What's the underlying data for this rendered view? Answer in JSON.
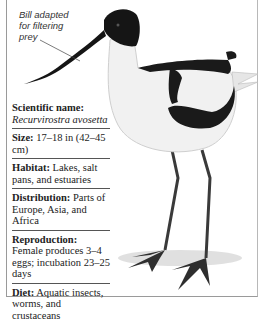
{
  "callout": {
    "text": "Bill adapted for filtering prey"
  },
  "image": {
    "subject": "Pied avocet standing, side view",
    "icon": "bird-illustration"
  },
  "facts": [
    {
      "key": "Scientific name:",
      "value": "Recurvirostra avosetta"
    },
    {
      "key": "Size:",
      "value": "17–18 in (42–45 cm)"
    },
    {
      "key": "Habitat:",
      "value": "Lakes, salt pans, and estuaries"
    },
    {
      "key": "Distribution:",
      "value": "Parts of Europe, Asia, and Africa"
    },
    {
      "key": "Reproduction:",
      "value": "Female produces 3–4 eggs; incubation 23–25 days"
    },
    {
      "key": "Diet:",
      "value": "Aquatic insects, worms, and crustaceans"
    }
  ],
  "colors": {
    "ink": "#222222",
    "frame": "#9a9a9a",
    "bird_black": "#1a1a1a",
    "bird_white": "#f2f2f2",
    "legs": "#3a3a3a"
  }
}
